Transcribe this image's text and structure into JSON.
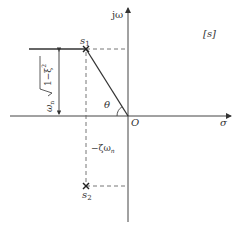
{
  "diagram": {
    "plane_label": "[s]",
    "axes": {
      "imag_label": "jω",
      "real_label": "σ",
      "origin_label": "O"
    },
    "poles": [
      {
        "label": "s",
        "sub": "1",
        "position": "upper"
      },
      {
        "label": "s",
        "sub": "2",
        "position": "lower"
      }
    ],
    "angle_label": "θ",
    "real_part_label": "−ζω",
    "real_part_sub": "n",
    "imag_part_label_prefix": "ω",
    "imag_part_label_sub": "n",
    "imag_part_label_sqrt": "1−ξ",
    "imag_part_label_sup": "2",
    "colors": {
      "line": "#333333",
      "dashed": "#555555",
      "background": "#ffffff"
    }
  }
}
